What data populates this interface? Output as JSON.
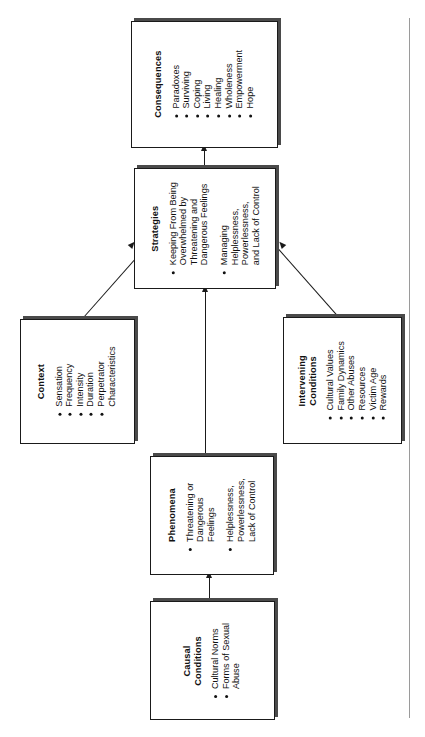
{
  "diagram": {
    "type": "flowchart",
    "orientation": "rotated-90-ccw",
    "nodes": [
      {
        "id": "consequences",
        "title": "Consequences",
        "items": [
          "Paradoxes",
          "Surviving",
          "Coping",
          "Living",
          "Healing",
          "Wholeness",
          "Empowerment",
          "Hope"
        ]
      },
      {
        "id": "strategies",
        "title": "Strategies",
        "items": [
          "Keeping From Being\nOverwhelmed by\nThreatening and\nDangerous Feelings",
          "Managing\nHelplessness,\nPowerlessness,\nand Lack of Control"
        ]
      },
      {
        "id": "context",
        "title": "Context",
        "items": [
          "Sensation",
          "Frequency",
          "Intensity",
          "Duration",
          "Perpetrator\nCharacteristics"
        ]
      },
      {
        "id": "intervening",
        "title": "Intervening\nConditions",
        "items": [
          "Cultural Values",
          "Family Dynamics",
          "Other Abuses",
          "Resources",
          "Victim Age",
          "Rewards"
        ]
      },
      {
        "id": "phenomena",
        "title": "Phenomena",
        "items": [
          "Threatening or\nDangerous\nFeelings",
          "Helplessness,\nPowerlessness,\nLack of Control"
        ]
      },
      {
        "id": "causal",
        "title": "Causal\nConditions",
        "items": [
          "Cultural Norms",
          "Forms of Sexual\nAbuse"
        ]
      }
    ],
    "edges": [
      {
        "from": "causal",
        "to": "phenomena",
        "style": "arrow"
      },
      {
        "from": "phenomena",
        "to": "strategies",
        "style": "arrow"
      },
      {
        "from": "context",
        "to": "strategies",
        "style": "arrow-diagonal"
      },
      {
        "from": "intervening",
        "to": "strategies",
        "style": "arrow-diagonal"
      },
      {
        "from": "strategies",
        "to": "consequences",
        "style": "arrow"
      }
    ],
    "colors": {
      "line": "#1a1a1a",
      "box_fill": "#ffffff",
      "shadow": "#4a4a4a",
      "page_edge": "#9a9a9a"
    }
  }
}
